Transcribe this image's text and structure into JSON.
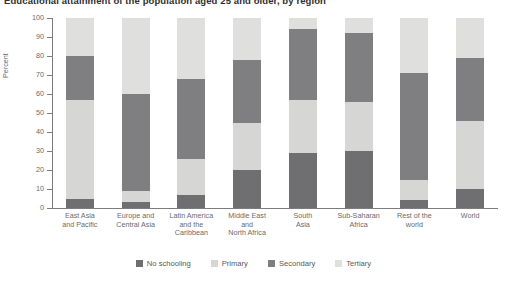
{
  "title": "Educational attainment of the population aged 25 and older, by region",
  "y_axis_title": "Percent",
  "legend": [
    {
      "label": "No schooling",
      "color": "#6f6f71",
      "name": "no-schooling"
    },
    {
      "label": "Primary",
      "color": "#d6d6d4",
      "name": "primary"
    },
    {
      "label": "Secondary",
      "color": "#7f7f81",
      "name": "secondary"
    },
    {
      "label": "Tertiary",
      "color": "#dfdfdd",
      "name": "tertiary"
    }
  ],
  "y_ticks": [
    "0",
    "10",
    "20",
    "30",
    "40",
    "50",
    "60",
    "70",
    "80",
    "90",
    "100"
  ],
  "chart_data": {
    "type": "bar",
    "subtype": "stacked-vertical-100",
    "title": "Educational attainment of the population aged 25 and older, by region",
    "xlabel": "",
    "ylabel": "Percent",
    "ylim": [
      0,
      100
    ],
    "ytick_step": 10,
    "grid": false,
    "legend_position": "bottom",
    "categories": [
      "East Asia\nand Pacific",
      "Europe and\nCentral Asia",
      "Latin America\nand the\nCaribbean",
      "Middle East\nand\nNorth Africa",
      "South\nAsia",
      "Sub-Saharan\nAfrica",
      "Rest of the\nworld",
      "World"
    ],
    "series": [
      {
        "name": "No schooling",
        "color": "#6f6f71",
        "values": [
          5,
          3,
          7,
          20,
          29,
          30,
          4,
          10
        ]
      },
      {
        "name": "Primary",
        "color": "#d6d6d4",
        "values": [
          52,
          6,
          19,
          25,
          28,
          26,
          11,
          36
        ]
      },
      {
        "name": "Secondary",
        "color": "#7f7f81",
        "values": [
          23,
          51,
          42,
          33,
          37,
          36,
          56,
          33
        ]
      },
      {
        "name": "Tertiary",
        "color": "#dfdfdd",
        "values": [
          20,
          40,
          32,
          22,
          6,
          8,
          29,
          21
        ]
      }
    ]
  }
}
